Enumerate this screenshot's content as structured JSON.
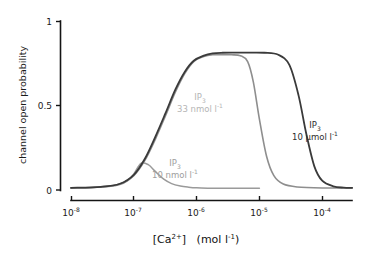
{
  "chart_data": {
    "type": "line",
    "title": "",
    "xlabel": "[Ca2+]  (mol l-1)",
    "ylabel": "channel open probability",
    "x_scale": "log",
    "xlim": [
      1e-08,
      0.0003
    ],
    "ylim": [
      0,
      1
    ],
    "grid": false,
    "legend_position": "inline-annotations",
    "xticks": [
      {
        "value": 1e-08,
        "mantissa": "10",
        "exponent": "-8"
      },
      {
        "value": 1e-07,
        "mantissa": "10",
        "exponent": "-7"
      },
      {
        "value": 1e-06,
        "mantissa": "10",
        "exponent": "-6"
      },
      {
        "value": 1e-05,
        "mantissa": "10",
        "exponent": "-5"
      },
      {
        "value": 0.0001,
        "mantissa": "10",
        "exponent": "-4"
      }
    ],
    "yticks": [
      "0",
      "0.5",
      "1"
    ],
    "series": [
      {
        "name": "IP3 10 nmol l-1",
        "color": "#9a9a9a",
        "x": [
          1e-08,
          2e-08,
          4e-08,
          6e-08,
          8e-08,
          1e-07,
          1.3e-07,
          1.7e-07,
          2.2e-07,
          3e-07,
          4e-07,
          5.5e-07,
          7.5e-07,
          1e-06,
          1.5e-06,
          2.5e-06,
          5e-06,
          1e-05
        ],
        "y": [
          0.012,
          0.014,
          0.02,
          0.032,
          0.055,
          0.095,
          0.158,
          0.15,
          0.11,
          0.064,
          0.038,
          0.024,
          0.017,
          0.013,
          0.011,
          0.01,
          0.01,
          0.01
        ]
      },
      {
        "name": "IP3 33 nmol l-1",
        "color": "#8e8e8e",
        "x": [
          1e-08,
          3e-08,
          6e-08,
          1e-07,
          1.5e-07,
          2.2e-07,
          3.2e-07,
          4.6e-07,
          6.5e-07,
          9e-07,
          1.3e-06,
          1.8e-06,
          2.6e-06,
          3.6e-06,
          5e-06,
          6.5e-06,
          8e-06,
          1e-05,
          1.3e-05,
          1.7e-05,
          2.4e-05,
          4e-05,
          0.0001,
          0.0003
        ],
        "y": [
          0.012,
          0.018,
          0.035,
          0.085,
          0.175,
          0.3,
          0.44,
          0.58,
          0.69,
          0.76,
          0.79,
          0.8,
          0.8,
          0.8,
          0.795,
          0.76,
          0.64,
          0.42,
          0.2,
          0.085,
          0.035,
          0.018,
          0.012,
          0.012
        ]
      },
      {
        "name": "IP3 10 umol l-1",
        "color": "#3a3a3a",
        "x": [
          1e-08,
          3e-08,
          6e-08,
          1e-07,
          1.5e-07,
          2.2e-07,
          3.2e-07,
          4.6e-07,
          6.5e-07,
          9e-07,
          1.3e-06,
          1.8e-06,
          2.6e-06,
          4e-06,
          7e-06,
          1.2e-05,
          2e-05,
          3e-05,
          4.2e-05,
          5.6e-05,
          7.5e-05,
          0.0001,
          0.00015,
          0.00022,
          0.0003
        ],
        "y": [
          0.013,
          0.019,
          0.037,
          0.09,
          0.185,
          0.315,
          0.455,
          0.595,
          0.7,
          0.765,
          0.795,
          0.808,
          0.812,
          0.813,
          0.813,
          0.812,
          0.8,
          0.74,
          0.56,
          0.33,
          0.14,
          0.055,
          0.022,
          0.014,
          0.013
        ]
      }
    ],
    "annotations": [
      {
        "id": "ann-ip3-10-nmol",
        "line1_main": "IP",
        "line1_sub": "3",
        "line2_main": "10 nmol l",
        "line2_sup": "-1",
        "color": "#9e9e9e",
        "x": 175,
        "y": 166
      },
      {
        "id": "ann-ip3-33-nmol",
        "line1_main": "IP",
        "line1_sub": "3",
        "line2_main": "33 nmol l",
        "line2_sup": "-1",
        "color": "#b5b5b5",
        "x": 200,
        "y": 100
      },
      {
        "id": "ann-ip3-10-umol",
        "line1_main": "IP",
        "line1_sub": "3",
        "line2_main": "10 μmol l",
        "line2_sup": "-1",
        "color": "#2e2e2e",
        "x": 315,
        "y": 128
      }
    ]
  },
  "axis_titles": {
    "y": "channel open probability",
    "x_bracket_open": "[Ca",
    "x_charge": "2+",
    "x_bracket_close": "]",
    "x_units_open": "(mol l",
    "x_units_sup": "-1",
    "x_units_close": ")"
  }
}
